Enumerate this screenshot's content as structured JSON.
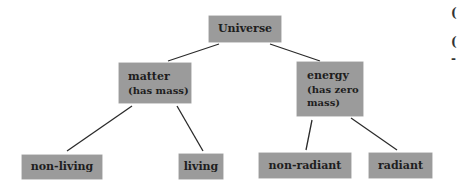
{
  "diagram": {
    "type": "tree",
    "root": {
      "label": "Universe"
    },
    "nodes": {
      "matter": {
        "label": "matter",
        "sub": "(has mass)"
      },
      "energy": {
        "label": "energy",
        "sub1": "(has zero",
        "sub2": "mass)"
      },
      "non_living": {
        "label": "non-living"
      },
      "living": {
        "label": "living"
      },
      "non_radiant": {
        "label": "non-radiant"
      },
      "radiant": {
        "label": "radiant"
      }
    },
    "edges": [
      [
        "Universe",
        "matter"
      ],
      [
        "Universe",
        "energy"
      ],
      [
        "matter",
        "non-living"
      ],
      [
        "matter",
        "living"
      ],
      [
        "energy",
        "non-radiant"
      ],
      [
        "energy",
        "radiant"
      ]
    ],
    "colors": {
      "box_fill": "#9b9b9b",
      "text": "#1e1e1e",
      "line": "#2a2a2a"
    }
  },
  "edge_text": {
    "g1": "(",
    "g2": "(",
    "g3": "-"
  }
}
